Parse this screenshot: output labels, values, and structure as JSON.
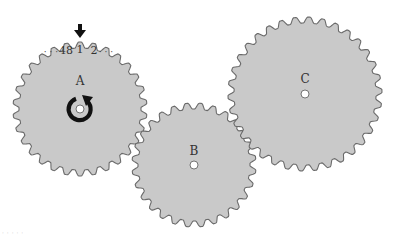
{
  "diagram": {
    "colors": {
      "gear_fill": "#c9c9c9",
      "gear_stroke": "#6a6a6a",
      "hole_fill": "#ffffff",
      "arrow_color": "#111111",
      "text_color": "#333333"
    },
    "gears": [
      {
        "id": "A",
        "label": "A",
        "cx": 80,
        "cy": 109,
        "outer_r": 67,
        "root_r": 61,
        "teeth": 30,
        "phase": 0,
        "label_dx": 0,
        "label_dy": -24
      },
      {
        "id": "B",
        "label": "B",
        "cx": 194,
        "cy": 165,
        "outer_r": 62,
        "root_r": 56,
        "teeth": 28,
        "phase": 6,
        "label_dx": 0,
        "label_dy": -10
      },
      {
        "id": "C",
        "label": "C",
        "cx": 305,
        "cy": 94,
        "outer_r": 77,
        "root_r": 71,
        "teeth": 34,
        "phase": 3,
        "label_dx": 0,
        "label_dy": -11
      }
    ],
    "tooth_numbering": {
      "gear": "A",
      "left_dots": "· · ·",
      "labels": [
        {
          "text": "48",
          "x": 66,
          "y": 54
        },
        {
          "text": "1",
          "x": 80,
          "y": 53
        },
        {
          "text": "2",
          "x": 94,
          "y": 54
        }
      ],
      "right_dots": "· · ·",
      "left_dots_x": 51,
      "left_dots_y": 55,
      "right_dots_x": 106,
      "right_dots_y": 55
    },
    "pointer": {
      "icon": "down-arrow-icon",
      "x": 80,
      "y_top": 24,
      "y_bottom": 37
    },
    "rotation": {
      "icon": "clockwise-arrow-icon",
      "direction": "clockwise",
      "gear": "A"
    },
    "watermark": "· ·  ·  · ·"
  }
}
